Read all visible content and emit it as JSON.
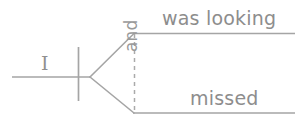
{
  "diagram": {
    "type": "reed-kellogg-sentence-diagram",
    "sentence": "I was looking and missed",
    "stroke_color": "#9a9a9a",
    "text_color": "#8d8d8d",
    "background_color": "#ffffff",
    "subject": {
      "label": "I",
      "role": "subject"
    },
    "conjunction": {
      "label": "and",
      "role": "coordinating-conjunction",
      "orientation": "vertical-bottom-to-top",
      "line_style": "dashed"
    },
    "predicates": [
      {
        "label": "was looking",
        "role": "compound-predicate-first",
        "position": "upper"
      },
      {
        "label": "missed",
        "role": "compound-predicate-second",
        "position": "lower"
      }
    ],
    "lines": {
      "baseline": {
        "x1": 12,
        "y1": 77,
        "x2": 90,
        "y2": 77
      },
      "subject_verb_divider": {
        "x1": 78,
        "y1": 47,
        "x2": 78,
        "y2": 101
      },
      "fork_upper": {
        "x1": 90,
        "y1": 77,
        "x2": 134,
        "y2": 33
      },
      "fork_lower": {
        "x1": 90,
        "y1": 77,
        "x2": 134,
        "y2": 113
      },
      "predicate_upper_baseline": {
        "x1": 134,
        "y1": 33,
        "x2": 295,
        "y2": 33
      },
      "predicate_lower_baseline": {
        "x1": 134,
        "y1": 113,
        "x2": 295,
        "y2": 113
      },
      "conjunction_connector": {
        "x1": 134,
        "y1": 33,
        "x2": 134,
        "y2": 113
      }
    }
  }
}
